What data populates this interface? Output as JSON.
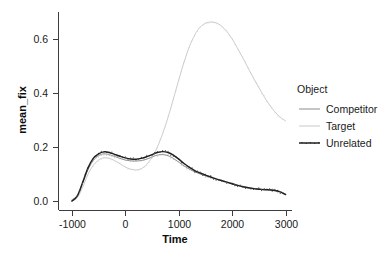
{
  "chart_data": {
    "type": "line",
    "title": "",
    "xlabel": "Time",
    "ylabel": "mean_fix",
    "xlim": [
      -1250,
      3120
    ],
    "ylim": [
      -0.035,
      0.7
    ],
    "xticks": [
      -1000,
      0,
      1000,
      2000,
      3000
    ],
    "xtick_labels": [
      "-1000",
      "0",
      "1000",
      "2000",
      "3000"
    ],
    "yticks": [
      0.0,
      0.2,
      0.4,
      0.6
    ],
    "ytick_labels": [
      "0.0",
      "0.2",
      "0.4",
      "0.6"
    ],
    "grid": false,
    "legend_position": "right",
    "legend_title": "Object",
    "x": [
      -1000,
      -900,
      -800,
      -700,
      -600,
      -500,
      -400,
      -300,
      -200,
      -100,
      0,
      100,
      200,
      300,
      400,
      500,
      600,
      700,
      800,
      900,
      1000,
      1100,
      1200,
      1300,
      1400,
      1500,
      1600,
      1700,
      1800,
      1900,
      2000,
      2100,
      2200,
      2300,
      2400,
      2500,
      2600,
      2700,
      2800,
      2900,
      3000
    ],
    "series": [
      {
        "name": "Competitor",
        "color": "#8c8c8c",
        "values": [
          0.005,
          0.02,
          0.065,
          0.115,
          0.15,
          0.168,
          0.175,
          0.172,
          0.165,
          0.158,
          0.152,
          0.149,
          0.148,
          0.15,
          0.155,
          0.163,
          0.17,
          0.172,
          0.168,
          0.158,
          0.144,
          0.13,
          0.118,
          0.108,
          0.1,
          0.093,
          0.087,
          0.081,
          0.075,
          0.07,
          0.064,
          0.059,
          0.054,
          0.05,
          0.047,
          0.045,
          0.043,
          0.042,
          0.04,
          0.035,
          0.026
        ]
      },
      {
        "name": "Target",
        "color": "#c9c9c9",
        "values": [
          0.0,
          0.012,
          0.05,
          0.098,
          0.132,
          0.152,
          0.16,
          0.158,
          0.15,
          0.138,
          0.126,
          0.118,
          0.115,
          0.12,
          0.135,
          0.162,
          0.2,
          0.25,
          0.31,
          0.378,
          0.448,
          0.515,
          0.572,
          0.615,
          0.644,
          0.658,
          0.663,
          0.66,
          0.648,
          0.628,
          0.6,
          0.566,
          0.53,
          0.492,
          0.455,
          0.42,
          0.386,
          0.356,
          0.33,
          0.31,
          0.297
        ]
      },
      {
        "name": "Unrelated",
        "color": "#1f1f1f",
        "values": [
          0.0,
          0.018,
          0.068,
          0.122,
          0.158,
          0.175,
          0.182,
          0.18,
          0.173,
          0.166,
          0.16,
          0.156,
          0.155,
          0.158,
          0.164,
          0.172,
          0.18,
          0.183,
          0.18,
          0.17,
          0.155,
          0.139,
          0.125,
          0.113,
          0.104,
          0.096,
          0.089,
          0.082,
          0.076,
          0.07,
          0.064,
          0.058,
          0.053,
          0.049,
          0.046,
          0.044,
          0.042,
          0.041,
          0.039,
          0.034,
          0.024
        ]
      }
    ],
    "legend_entries": [
      {
        "label": "Competitor",
        "color": "#8c8c8c"
      },
      {
        "label": "Target",
        "color": "#c9c9c9"
      },
      {
        "label": "Unrelated",
        "color": "#1f1f1f"
      }
    ]
  }
}
